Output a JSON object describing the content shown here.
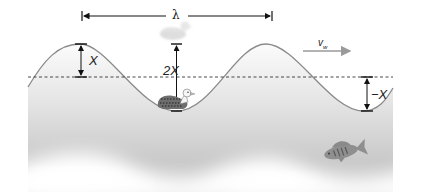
{
  "diagram": {
    "type": "transverse water wave",
    "labels": {
      "wavelength": "λ",
      "amplitude_crest": "X",
      "crest_to_trough": "2X",
      "amplitude_trough": "−X",
      "wave_velocity_main": "v",
      "wave_velocity_sub": "w"
    },
    "elements": [
      {
        "name": "water-surface-wave",
        "description": "sinusoidal surface with two crests and two troughs"
      },
      {
        "name": "equilibrium-line",
        "description": "dashed horizontal line at mean water level"
      },
      {
        "name": "wavelength-arrow",
        "description": "double-headed arrow spanning one wavelength between crests"
      },
      {
        "name": "duck-at-crest",
        "description": "faded duck at crest position"
      },
      {
        "name": "duck-at-trough",
        "description": "duck floating in trough"
      },
      {
        "name": "fish",
        "description": "fish swimming under water"
      },
      {
        "name": "velocity-arrow",
        "description": "arrow pointing right indicating wave propagation direction"
      }
    ],
    "colors": {
      "water_light": "#f4f4f4",
      "water_dark": "#c8c8c8",
      "surface_line": "#8a8a8a",
      "arrow": "#111111",
      "velocity_arrow": "#9a9a9a",
      "fish": "#8d8d8d"
    }
  }
}
